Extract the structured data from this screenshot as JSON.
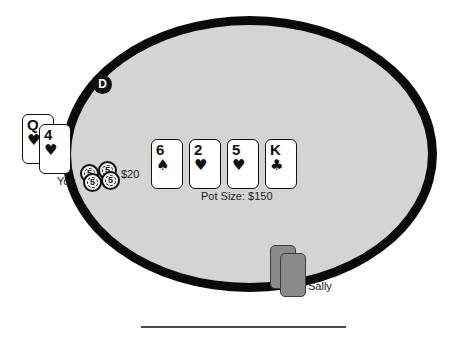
{
  "table": {
    "felt_color": "#d4d4d4",
    "rail_color": "#0a0a0a"
  },
  "dealer_button": {
    "label": "D"
  },
  "player": {
    "name_label": "You",
    "bet_label": "$20",
    "hole_cards": [
      {
        "rank": "Q",
        "suit": "♥",
        "suit_name": "hearts"
      },
      {
        "rank": "4",
        "suit": "♥",
        "suit_name": "hearts"
      }
    ],
    "chips": [
      {
        "value": "5"
      },
      {
        "value": "5"
      },
      {
        "value": "5"
      },
      {
        "value": "5"
      }
    ]
  },
  "board": {
    "pot_label": "Pot Size: $150",
    "cards": [
      {
        "rank": "6",
        "suit": "♠",
        "suit_name": "spades"
      },
      {
        "rank": "2",
        "suit": "♥",
        "suit_name": "hearts"
      },
      {
        "rank": "5",
        "suit": "♥",
        "suit_name": "hearts"
      },
      {
        "rank": "K",
        "suit": "♣",
        "suit_name": "clubs"
      }
    ]
  },
  "opponent": {
    "name_label": "Sally",
    "hole_cards_face_down": 2
  }
}
